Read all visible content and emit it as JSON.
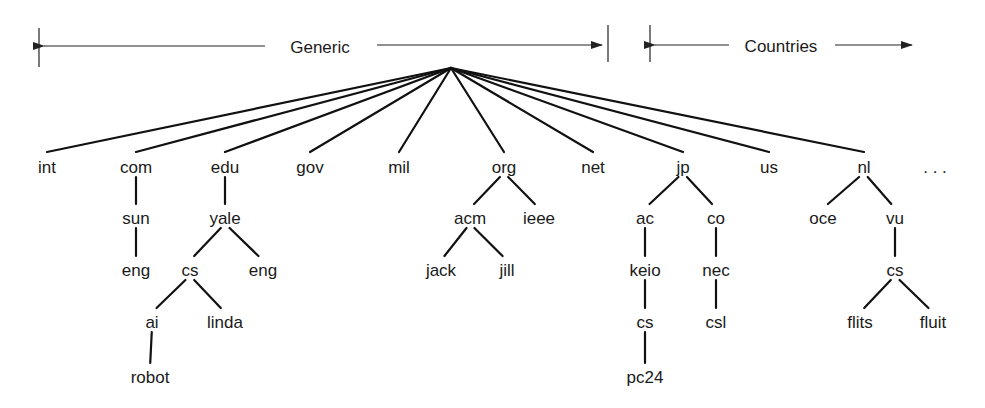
{
  "header": {
    "generic_label": "Generic",
    "countries_label": "Countries"
  },
  "root": {
    "x": 451,
    "y": 68
  },
  "nodes": [
    {
      "id": "int",
      "label": "int",
      "x": 47,
      "y": 167,
      "parent": "root"
    },
    {
      "id": "com",
      "label": "com",
      "x": 136,
      "y": 167,
      "parent": "root"
    },
    {
      "id": "edu",
      "label": "edu",
      "x": 225,
      "y": 167,
      "parent": "root"
    },
    {
      "id": "gov",
      "label": "gov",
      "x": 310,
      "y": 167,
      "parent": "root"
    },
    {
      "id": "mil",
      "label": "mil",
      "x": 399,
      "y": 167,
      "parent": "root"
    },
    {
      "id": "org",
      "label": "org",
      "x": 504,
      "y": 167,
      "parent": "root"
    },
    {
      "id": "net",
      "label": "net",
      "x": 593,
      "y": 167,
      "parent": "root"
    },
    {
      "id": "jp",
      "label": "jp",
      "x": 683,
      "y": 167,
      "parent": "root"
    },
    {
      "id": "us",
      "label": "us",
      "x": 769,
      "y": 167,
      "parent": "root"
    },
    {
      "id": "nl",
      "label": "nl",
      "x": 864,
      "y": 167,
      "parent": "root"
    },
    {
      "id": "com_sun",
      "label": "sun",
      "x": 136,
      "y": 218,
      "parent": "com"
    },
    {
      "id": "com_sun_eng",
      "label": "eng",
      "x": 136,
      "y": 270,
      "parent": "com_sun"
    },
    {
      "id": "edu_yale",
      "label": "yale",
      "x": 225,
      "y": 218,
      "parent": "edu"
    },
    {
      "id": "yale_cs",
      "label": "cs",
      "x": 190,
      "y": 270,
      "parent": "edu_yale"
    },
    {
      "id": "yale_eng",
      "label": "eng",
      "x": 263,
      "y": 270,
      "parent": "edu_yale"
    },
    {
      "id": "cs_ai",
      "label": "ai",
      "x": 152,
      "y": 322,
      "parent": "yale_cs"
    },
    {
      "id": "cs_linda",
      "label": "linda",
      "x": 225,
      "y": 322,
      "parent": "yale_cs"
    },
    {
      "id": "ai_robot",
      "label": "robot",
      "x": 150,
      "y": 377,
      "parent": "cs_ai"
    },
    {
      "id": "org_acm",
      "label": "acm",
      "x": 470,
      "y": 218,
      "parent": "org"
    },
    {
      "id": "org_ieee",
      "label": "ieee",
      "x": 539,
      "y": 218,
      "parent": "org"
    },
    {
      "id": "acm_jack",
      "label": "jack",
      "x": 441,
      "y": 270,
      "parent": "org_acm"
    },
    {
      "id": "acm_jill",
      "label": "jill",
      "x": 507,
      "y": 270,
      "parent": "org_acm"
    },
    {
      "id": "jp_ac",
      "label": "ac",
      "x": 645,
      "y": 218,
      "parent": "jp"
    },
    {
      "id": "jp_co",
      "label": "co",
      "x": 716,
      "y": 218,
      "parent": "jp"
    },
    {
      "id": "ac_keio",
      "label": "keio",
      "x": 645,
      "y": 270,
      "parent": "jp_ac"
    },
    {
      "id": "keio_cs",
      "label": "cs",
      "x": 645,
      "y": 322,
      "parent": "ac_keio"
    },
    {
      "id": "cs_pc24",
      "label": "pc24",
      "x": 645,
      "y": 377,
      "parent": "keio_cs"
    },
    {
      "id": "co_nec",
      "label": "nec",
      "x": 716,
      "y": 270,
      "parent": "jp_co"
    },
    {
      "id": "nec_csl",
      "label": "csl",
      "x": 716,
      "y": 322,
      "parent": "co_nec"
    },
    {
      "id": "nl_oce",
      "label": "oce",
      "x": 823,
      "y": 218,
      "parent": "nl"
    },
    {
      "id": "nl_vu",
      "label": "vu",
      "x": 895,
      "y": 218,
      "parent": "nl"
    },
    {
      "id": "vu_cs",
      "label": "cs",
      "x": 895,
      "y": 270,
      "parent": "nl_vu"
    },
    {
      "id": "cs_flits",
      "label": "flits",
      "x": 860,
      "y": 322,
      "parent": "vu_cs"
    },
    {
      "id": "cs_fluit",
      "label": "fluit",
      "x": 933,
      "y": 322,
      "parent": "vu_cs"
    }
  ],
  "ellipsis": {
    "label": ". . .",
    "x": 935,
    "y": 167
  },
  "colors": {
    "ink": "#1a1a1a",
    "background": "#ffffff"
  }
}
